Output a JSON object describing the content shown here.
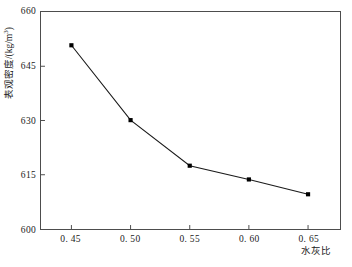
{
  "chart_data": {
    "type": "line",
    "title": "",
    "xlabel": "水灰比",
    "ylabel": "表观密度/(kg/m³)",
    "ylabel_prefix": "表观密度/(kg/m",
    "ylabel_exponent": "3",
    "ylabel_suffix": ")",
    "x": [
      0.45,
      0.5,
      0.55,
      0.6,
      0.65
    ],
    "values": [
      650.8,
      630.1,
      617.5,
      613.7,
      609.6
    ],
    "series": [
      {
        "name": "表观密度",
        "values": [
          650.8,
          630.1,
          617.5,
          613.7,
          609.6
        ]
      }
    ],
    "xlim": [
      0.4243,
      0.677
    ],
    "ylim": [
      600,
      660
    ],
    "xticks": [
      0.45,
      0.5,
      0.55,
      0.6,
      0.65
    ],
    "xtick_labels": [
      "0. 45",
      "0. 50",
      "0. 55",
      "0. 60",
      "0. 65"
    ],
    "yticks": [
      600,
      615,
      630,
      645,
      660
    ],
    "ytick_labels": [
      "600",
      "615",
      "630",
      "645",
      "660"
    ],
    "grid": false,
    "legend": false,
    "marker": "square",
    "marker_color": "#000000",
    "line_color": "#1a1a1a",
    "frame_color": "#4d4d4d",
    "background": "#ffffff"
  }
}
